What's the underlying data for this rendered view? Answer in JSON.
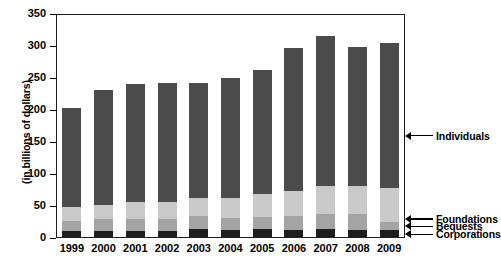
{
  "chart_data": {
    "type": "bar",
    "subtype": "stacked-bar",
    "title": "",
    "xlabel": "",
    "ylabel": "(in billions of dollars)",
    "ylim": [
      0,
      350
    ],
    "ytick_values": [
      0,
      50,
      100,
      150,
      200,
      250,
      300,
      350
    ],
    "ytick_labels": [
      "0",
      "50",
      "100",
      "150",
      "200",
      "250",
      "300",
      "350"
    ],
    "grid": false,
    "legend_position": "right-callout",
    "categories": [
      "1999",
      "2000",
      "2001",
      "2002",
      "2003",
      "2004",
      "2005",
      "2006",
      "2007",
      "2008",
      "2009"
    ],
    "series": [
      {
        "name": "Corporations",
        "color": "#1e1e1e",
        "values": [
          11,
          11,
          11,
          11,
          14,
          12,
          14,
          13,
          14,
          13,
          12
        ]
      },
      {
        "name": "Bequests",
        "color": "#a4a4a4",
        "values": [
          15,
          18,
          19,
          19,
          20,
          20,
          19,
          22,
          24,
          24,
          13
        ]
      },
      {
        "name": "Foundations",
        "color": "#c9c9c9",
        "values": [
          23,
          23,
          27,
          27,
          28,
          30,
          36,
          39,
          43,
          44,
          53
        ]
      },
      {
        "name": "Individuals",
        "color": "#4b4b4b",
        "values": [
          154,
          179,
          184,
          186,
          181,
          188,
          193,
          223,
          234,
          218,
          227
        ]
      }
    ],
    "totals": [
      203,
      231,
      241,
      243,
      243,
      250,
      262,
      297,
      315,
      299,
      305
    ],
    "annotations": [
      {
        "label": "Individuals",
        "series": "Individuals",
        "y_value": 160
      },
      {
        "label": "Foundations",
        "series": "Foundations",
        "y_value": 30
      },
      {
        "label": "Bequests",
        "series": "Bequests",
        "y_value": 18
      },
      {
        "label": "Corporations",
        "series": "Corporations",
        "y_value": 6
      }
    ]
  },
  "axis": {
    "y_title": "(in billions of dollars)"
  },
  "legend": {
    "items": [
      {
        "label": "Individuals"
      },
      {
        "label": "Foundations"
      },
      {
        "label": "Bequests"
      },
      {
        "label": "Corporations"
      }
    ]
  },
  "colors": {
    "individuals": "#4b4b4b",
    "foundations": "#c9c9c9",
    "bequests": "#a4a4a4",
    "corporations": "#1e1e1e",
    "axis": "#1c1c1c",
    "background": "#ffffff"
  }
}
